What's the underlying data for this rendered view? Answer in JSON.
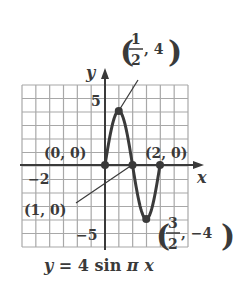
{
  "chart_data": {
    "type": "line",
    "title": "y = 4 sin π x",
    "xlabel": "x",
    "ylabel": "y",
    "xlim": [
      -3,
      3
    ],
    "ylim": [
      -6,
      6
    ],
    "grid": true,
    "function": "y = 4 sin(pi x)",
    "domain": [
      0,
      2
    ],
    "series": [
      {
        "name": "y = 4 sin π x",
        "x": [
          0,
          0.25,
          0.5,
          0.75,
          1,
          1.25,
          1.5,
          1.75,
          2
        ],
        "y": [
          0,
          2.83,
          4,
          2.83,
          0,
          -2.83,
          -4,
          -2.83,
          0
        ]
      }
    ],
    "points": [
      {
        "label": "(0, 0)",
        "x": 0,
        "y": 0
      },
      {
        "label": "(1/2, 4)",
        "x": 0.5,
        "y": 4
      },
      {
        "label": "(1, 0)",
        "x": 1,
        "y": 0
      },
      {
        "label": "(3/2, -4)",
        "x": 1.5,
        "y": -4
      },
      {
        "label": "(2, 0)",
        "x": 2,
        "y": 0
      }
    ],
    "tick_labels": {
      "x": [
        "-2"
      ],
      "y": [
        "5",
        "-5"
      ]
    }
  },
  "labels": {
    "y_axis": "y",
    "x_axis": "x",
    "tick_y_pos": "5",
    "tick_y_neg": "−5",
    "tick_x_neg": "−2",
    "pt_origin": "(0, 0)",
    "pt_two": "(2, 0)",
    "pt_one": "(1, 0)",
    "pt_max_num": "1",
    "pt_max_den": "2",
    "pt_max_y": ", 4",
    "pt_min_num": "3",
    "pt_min_den": "2",
    "pt_min_y": ", −4",
    "caption_y": "y",
    "caption_eq": " = 4 sin ",
    "caption_pi": "π",
    "caption_x": " x"
  },
  "colors": {
    "ink": "#3a3a3a",
    "grid": "#9a9a9a"
  }
}
